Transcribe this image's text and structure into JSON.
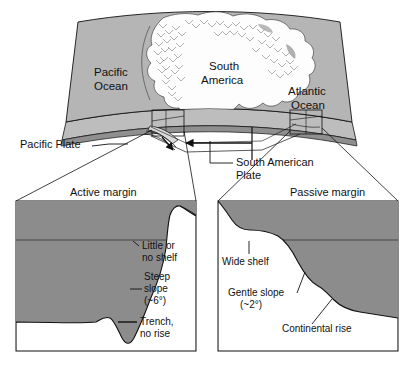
{
  "figure": {
    "type": "diagram"
  },
  "map": {
    "labels": {
      "pacific_ocean_line1": "Pacific",
      "pacific_ocean_line2": "Ocean",
      "south_america_line1": "South",
      "south_america_line2": "America",
      "atlantic_ocean_line1": "Atlantic",
      "atlantic_ocean_line2": "Ocean",
      "pacific_plate": "Pacific Plate",
      "south_american_plate_line1": "South  American",
      "south_american_plate_line2": "Plate"
    }
  },
  "panels": {
    "left": {
      "title": "Active margin",
      "annotations": {
        "shelf_line1": "Little or",
        "shelf_line2": "no shelf",
        "slope_line1": "Steep",
        "slope_line2": "slope",
        "slope_line3": "(~6°)",
        "trench_line1": "Trench,",
        "trench_line2": "no rise"
      }
    },
    "right": {
      "title": "Passive margin",
      "annotations": {
        "shelf": "Wide shelf",
        "slope_line1": "Gentle slope",
        "slope_line2": "(~2°)",
        "rise": "Continental rise"
      }
    }
  },
  "colors": {
    "ocean_map": "#b5b5b5",
    "land_map": "#fdfdfd",
    "water_panel": "#8c8c8c",
    "rock_panel": "#ffffff",
    "mantle_band": "#9a9a9a",
    "outline": "#111111",
    "background": "#ffffff"
  }
}
